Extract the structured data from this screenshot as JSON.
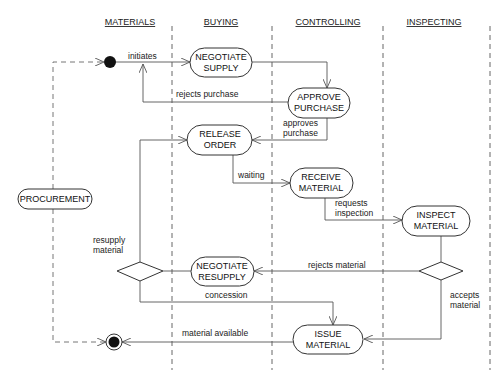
{
  "diagram": {
    "type": "uml-activity-diagram",
    "swimlanes": [
      {
        "id": "materials",
        "label": "MATERIALS"
      },
      {
        "id": "buying",
        "label": "BUYING"
      },
      {
        "id": "controlling",
        "label": "CONTROLLING"
      },
      {
        "id": "inspecting",
        "label": "INSPECTING"
      }
    ],
    "nodes": {
      "procurement": {
        "line1": "PROCUREMENT"
      },
      "negotiate_supply": {
        "line1": "NEGOTIATE",
        "line2": "SUPPLY"
      },
      "approve_purchase": {
        "line1": "APPROVE",
        "line2": "PURCHASE"
      },
      "release_order": {
        "line1": "RELEASE",
        "line2": "ORDER"
      },
      "receive_material": {
        "line1": "RECEIVE",
        "line2": "MATERIAL"
      },
      "inspect_material": {
        "line1": "INSPECT",
        "line2": "MATERIAL"
      },
      "negotiate_resupply": {
        "line1": "NEGOTIATE",
        "line2": "RESUPPLY"
      },
      "issue_material": {
        "line1": "ISSUE",
        "line2": "MATERIAL"
      }
    },
    "labels": {
      "initiates": "initiates",
      "rejects_purchase": "rejects purchase",
      "approves_l1": "approves",
      "approves_l2": "purchase",
      "waiting": "waiting",
      "requests_l1": "requests",
      "requests_l2": "inspection",
      "resupply_l1": "resupply",
      "resupply_l2": "material",
      "rejects_material": "rejects material",
      "concession": "concession",
      "accepts_l1": "accepts",
      "accepts_l2": "material",
      "material_available": "material available"
    },
    "edges": [
      {
        "from": "start",
        "to": "negotiate_supply",
        "label": "initiates"
      },
      {
        "from": "negotiate_supply",
        "to": "approve_purchase"
      },
      {
        "from": "approve_purchase",
        "to": "initiates-flow",
        "label": "rejects purchase"
      },
      {
        "from": "approve_purchase",
        "to": "release_order",
        "label": "approves purchase"
      },
      {
        "from": "release_order",
        "to": "receive_material",
        "label": "waiting"
      },
      {
        "from": "receive_material",
        "to": "inspect_material",
        "label": "requests inspection"
      },
      {
        "from": "inspect_material",
        "to": "decision-inspect"
      },
      {
        "from": "decision-inspect",
        "to": "negotiate_resupply",
        "label": "rejects material"
      },
      {
        "from": "decision-inspect",
        "to": "issue_material",
        "label": "accepts material"
      },
      {
        "from": "negotiate_resupply",
        "to": "decision-resupply"
      },
      {
        "from": "decision-resupply",
        "to": "release_order",
        "label": "resupply material"
      },
      {
        "from": "decision-resupply",
        "to": "issue_material",
        "label": "concession"
      },
      {
        "from": "issue_material",
        "to": "end",
        "label": "material available"
      },
      {
        "from": "procurement",
        "to": "start",
        "style": "dashed"
      },
      {
        "from": "procurement",
        "to": "end",
        "style": "dashed"
      }
    ]
  }
}
